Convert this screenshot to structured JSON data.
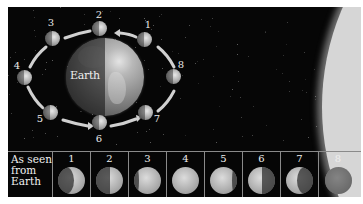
{
  "diagram": {
    "center_label": "Earth",
    "row_label": "As seen from Earth",
    "row_label_lines": [
      "As seen",
      "from",
      "Earth"
    ],
    "colors": {
      "space": "#060606",
      "sun": "#d6d6d6",
      "grid_line": "#8a8a8a",
      "text": "#eeeeee"
    },
    "orbit_positions": [
      {
        "label": "1",
        "x": 136,
        "y": 32,
        "lx": 140,
        "ly": 17
      },
      {
        "label": "2",
        "x": 91,
        "y": 21,
        "lx": 91,
        "ly": 7
      },
      {
        "label": "3",
        "x": 44,
        "y": 31,
        "lx": 43,
        "ly": 15
      },
      {
        "label": "4",
        "x": 16,
        "y": 70,
        "lx": 9,
        "ly": 58
      },
      {
        "label": "5",
        "x": 42,
        "y": 105,
        "lx": 32,
        "ly": 111
      },
      {
        "label": "6",
        "x": 91,
        "y": 115,
        "lx": 91,
        "ly": 131
      },
      {
        "label": "7",
        "x": 137,
        "y": 105,
        "lx": 149,
        "ly": 111
      },
      {
        "label": "8",
        "x": 165,
        "y": 69,
        "lx": 173,
        "ly": 57
      }
    ],
    "phases": [
      {
        "label": "1",
        "name": "waxing crescent"
      },
      {
        "label": "2",
        "name": "first quarter"
      },
      {
        "label": "3",
        "name": "waxing gibbous"
      },
      {
        "label": "4",
        "name": "full moon"
      },
      {
        "label": "5",
        "name": "waning gibbous"
      },
      {
        "label": "6",
        "name": "last quarter"
      },
      {
        "label": "7",
        "name": "waning crescent"
      },
      {
        "label": "8",
        "name": "new moon"
      }
    ]
  }
}
